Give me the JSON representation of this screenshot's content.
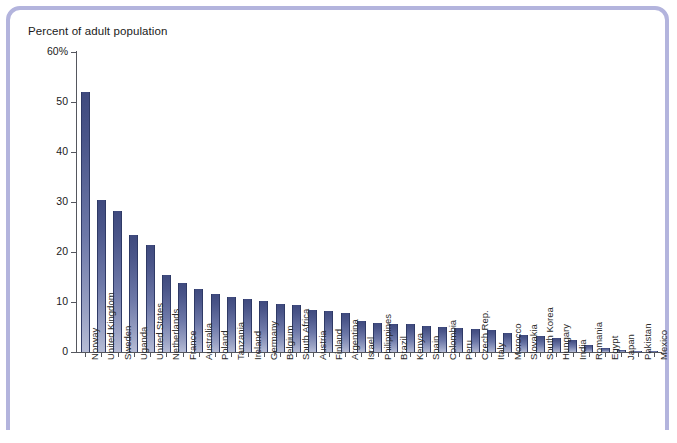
{
  "chart_data": {
    "type": "bar",
    "title": "Percent of adult population",
    "xlabel": "",
    "ylabel": "Percent of adult population",
    "ylim": [
      0,
      60
    ],
    "yticks": [
      "0",
      "10",
      "20",
      "30",
      "40",
      "50",
      "60%"
    ],
    "ytick_values": [
      0,
      10,
      20,
      30,
      40,
      50,
      60
    ],
    "grid": false,
    "legend": null,
    "bar_color": "#4a5589",
    "categories": [
      "Norway",
      "United Kingdom",
      "Sweden",
      "Uganda",
      "United States",
      "Netherlands",
      "France",
      "Australia",
      "Poland",
      "Tanzania",
      "Ireland",
      "Germany",
      "Belgium",
      "South Africa",
      "Austria",
      "Finland",
      "Argentina",
      "Israel",
      "Philippines",
      "Brazil",
      "Kenya",
      "Spain",
      "Colombia",
      "Peru",
      "Czech Rep.",
      "Italy",
      "Morocco",
      "Slovakia",
      "South Korea",
      "Hungary",
      "India",
      "Romania",
      "Egypt",
      "Japan",
      "Pakistan",
      "Mexico"
    ],
    "values": [
      52.0,
      30.4,
      28.3,
      23.5,
      21.5,
      15.5,
      13.8,
      12.7,
      11.7,
      11.0,
      10.6,
      10.2,
      9.7,
      9.5,
      8.4,
      8.2,
      7.8,
      6.3,
      5.8,
      5.7,
      5.6,
      5.3,
      5.1,
      4.9,
      4.6,
      4.4,
      3.9,
      3.4,
      3.2,
      2.8,
      2.5,
      1.5,
      0.8,
      0.5,
      0.3,
      0.2
    ]
  },
  "frame": {
    "border_color": "#b3b4dd"
  }
}
